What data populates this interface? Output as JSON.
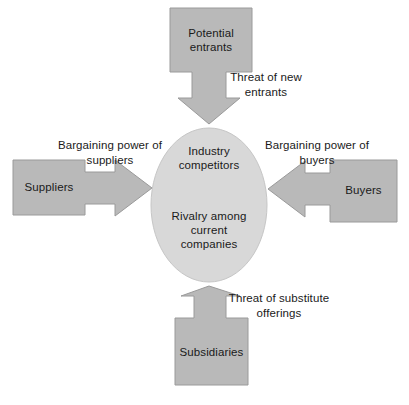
{
  "diagram": {
    "colors": {
      "box_fill": "#b9b9b9",
      "box_stroke": "#9a9a9a",
      "circle_fill": "#d8d8d8",
      "circle_stroke": "#c6c6c6",
      "text": "#1a1a1a",
      "background": "#ffffff"
    },
    "center": {
      "line1": "Industry",
      "line2": "competitors",
      "line3": "Rivalry among",
      "line4": "current",
      "line5": "companies"
    },
    "nodes": {
      "top": {
        "line1": "Potential",
        "line2": "entrants"
      },
      "left": {
        "line1": "Suppliers"
      },
      "right": {
        "line1": "Buyers"
      },
      "bottom": {
        "line1": "Subsidiaries"
      }
    },
    "edges": {
      "top": {
        "line1": "Threat of new",
        "line2": "entrants"
      },
      "left": {
        "line1": "Bargaining power of",
        "line2": "suppliers"
      },
      "right": {
        "line1": "Bargaining power of",
        "line2": "buyers"
      },
      "bottom": {
        "line1": "Threat of substitute",
        "line2": "offerings"
      }
    }
  }
}
